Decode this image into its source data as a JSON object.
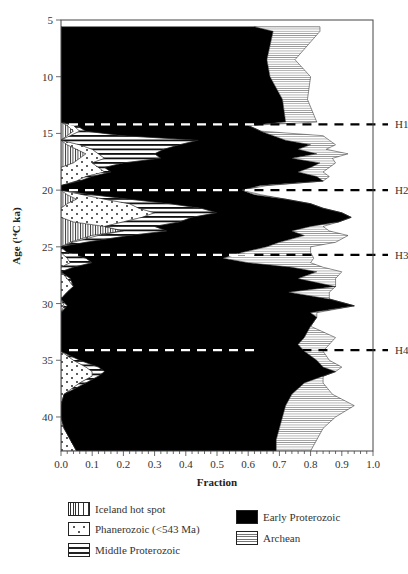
{
  "chart_data": {
    "type": "area",
    "subtype": "stacked-horizontal-fraction-profile",
    "title": "",
    "xlabel": "Fraction",
    "ylabel": "Age (14C ka)",
    "ylabel_display": "Age (¹⁴C ka)",
    "xlim": [
      0.0,
      1.0
    ],
    "ylim": [
      5,
      43
    ],
    "y_inverted": true,
    "grid": false,
    "x_ticks": [
      "0.0",
      "0.1",
      "0.2",
      "0.3",
      "0.4",
      "0.5",
      "0.6",
      "0.7",
      "0.8",
      "0.9",
      "1.0"
    ],
    "y_ticks": [
      "5",
      "10",
      "15",
      "20",
      "25",
      "30",
      "35",
      "40"
    ],
    "series_order": [
      "Iceland hot spot",
      "Phanerozoic (<543 Ma)",
      "Middle Proterozoic",
      "Early Proterozoic",
      "Archean"
    ],
    "note": "boundaries are cumulative fractions (right edge of each stacked layer) at each age; last layer Archean ends at cumulative total",
    "age": [
      5.6,
      6.0,
      8.5,
      10.0,
      12.0,
      14.0,
      14.3,
      14.8,
      15.2,
      15.6,
      16.0,
      16.4,
      16.8,
      17.2,
      17.6,
      18.0,
      18.4,
      18.8,
      19.2,
      19.6,
      20.0,
      20.4,
      20.8,
      21.2,
      21.6,
      22.0,
      22.4,
      22.8,
      23.2,
      23.6,
      24.0,
      24.6,
      25.0,
      25.5,
      26.0,
      26.4,
      26.8,
      27.2,
      27.8,
      28.5,
      29.0,
      29.6,
      30.2,
      30.8,
      31.2,
      32.0,
      33.0,
      33.6,
      34.2,
      35.0,
      35.6,
      36.0,
      36.4,
      37.0,
      38.0,
      39.0,
      40.0,
      41.0,
      42.0,
      43.0
    ],
    "series": [
      {
        "name": "Iceland hot spot",
        "pattern": "vertical-lines",
        "values": [
          0,
          0,
          0,
          0,
          0,
          0,
          0.02,
          0.04,
          0.02,
          0.0,
          0.02,
          0.05,
          0.08,
          0.06,
          0.04,
          0.0,
          0.0,
          0.0,
          0.0,
          0.0,
          0.0,
          0.02,
          0.05,
          0.02,
          0.0,
          0.0,
          0.0,
          0.04,
          0.14,
          0.2,
          0.1,
          0.03,
          0.0,
          0.0,
          0.0,
          0.0,
          0.0,
          0.0,
          0.0,
          0.0,
          0.0,
          0.0,
          0.0,
          0.0,
          0.0,
          0.0,
          0.0,
          0.0,
          0.0,
          0.0,
          0.0,
          0.0,
          0.0,
          0.0,
          0.0,
          0.0,
          0.0,
          0.0,
          0.0,
          0.0
        ]
      },
      {
        "name": "Phanerozoic (<543 Ma)",
        "pattern": "dots",
        "values": [
          0,
          0,
          0,
          0,
          0,
          0,
          0.04,
          0.06,
          0.03,
          0.0,
          0.06,
          0.1,
          0.12,
          0.14,
          0.1,
          0.12,
          0.14,
          0.08,
          0.05,
          0.0,
          0.0,
          0.07,
          0.14,
          0.22,
          0.25,
          0.3,
          0.26,
          0.2,
          0.14,
          0.2,
          0.12,
          0.04,
          0.0,
          0.0,
          0.02,
          0.03,
          0.0,
          0.0,
          0.02,
          0.04,
          0.02,
          0.0,
          0.01,
          0.0,
          0.0,
          0.0,
          0.0,
          0.0,
          0.0,
          0.04,
          0.08,
          0.1,
          0.1,
          0.06,
          0.01,
          0.0,
          0.0,
          0.01,
          0.03,
          0.05
        ]
      },
      {
        "name": "Middle Proterozoic",
        "pattern": "horizontal-lines",
        "values": [
          0,
          0,
          0,
          0,
          0,
          0,
          0.05,
          0.08,
          0.2,
          0.44,
          0.38,
          0.33,
          0.3,
          0.32,
          0.2,
          0.14,
          0.16,
          0.1,
          0.06,
          0.0,
          0.0,
          0.1,
          0.22,
          0.35,
          0.45,
          0.5,
          0.42,
          0.38,
          0.3,
          0.34,
          0.22,
          0.08,
          0.0,
          0.02,
          0.08,
          0.1,
          0.04,
          0.0,
          0.03,
          0.04,
          0.02,
          0.0,
          0.02,
          0.0,
          0.0,
          0.0,
          0.0,
          0.0,
          0.0,
          0.06,
          0.12,
          0.14,
          0.12,
          0.08,
          0.01,
          0.0,
          0.0,
          0.01,
          0.03,
          0.05
        ]
      },
      {
        "name": "Early Proterozoic",
        "pattern": "solid-black",
        "values": [
          0.62,
          0.68,
          0.66,
          0.67,
          0.71,
          0.72,
          0.6,
          0.64,
          0.68,
          0.72,
          0.8,
          0.76,
          0.82,
          0.74,
          0.83,
          0.8,
          0.76,
          0.82,
          0.84,
          0.64,
          0.58,
          0.62,
          0.72,
          0.8,
          0.84,
          0.9,
          0.93,
          0.89,
          0.8,
          0.74,
          0.78,
          0.7,
          0.66,
          0.58,
          0.52,
          0.6,
          0.74,
          0.82,
          0.76,
          0.88,
          0.73,
          0.86,
          0.94,
          0.8,
          0.82,
          0.8,
          0.78,
          0.76,
          0.78,
          0.82,
          0.84,
          0.88,
          0.84,
          0.78,
          0.74,
          0.72,
          0.71,
          0.7,
          0.69,
          0.69
        ]
      },
      {
        "name": "Archean",
        "pattern": "fine-horizontal-lines",
        "values": [
          0.83,
          0.83,
          0.75,
          0.8,
          0.79,
          0.82,
          0.6,
          0.64,
          0.84,
          0.86,
          0.88,
          0.85,
          0.92,
          0.87,
          0.88,
          0.86,
          0.84,
          0.86,
          0.84,
          0.66,
          0.58,
          0.64,
          0.72,
          0.8,
          0.84,
          0.9,
          0.93,
          0.89,
          0.84,
          0.86,
          0.92,
          0.88,
          0.8,
          0.8,
          0.81,
          0.8,
          0.84,
          0.9,
          0.88,
          0.88,
          0.86,
          0.86,
          0.94,
          0.82,
          0.82,
          0.8,
          0.88,
          0.86,
          0.84,
          0.86,
          0.9,
          0.88,
          0.84,
          0.84,
          0.87,
          0.94,
          0.88,
          0.84,
          0.82,
          0.8
        ]
      }
    ],
    "reference_lines": [
      {
        "label": "H1",
        "age": 14.2
      },
      {
        "label": "H2",
        "age": 20.0
      },
      {
        "label": "H3",
        "age": 25.7
      },
      {
        "label": "H4",
        "age": 34.1
      }
    ],
    "legend": {
      "position": "bottom",
      "entries": [
        {
          "label": "Iceland hot spot",
          "swatch": "iceland"
        },
        {
          "label": "Phanerozoic (<543 Ma)",
          "swatch": "phan"
        },
        {
          "label": "Middle Proterozoic",
          "swatch": "middle"
        },
        {
          "label": "Early Proterozoic",
          "swatch": "early"
        },
        {
          "label": "Archean",
          "swatch": "archean"
        }
      ]
    }
  }
}
